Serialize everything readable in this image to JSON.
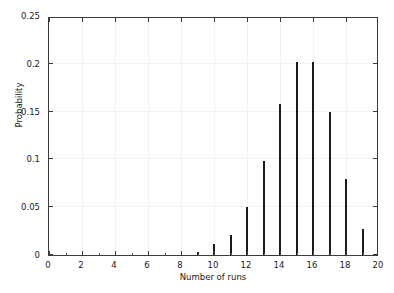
{
  "chart_data": {
    "type": "bar",
    "title": "",
    "subtitle": "",
    "xlabel": "Number of runs",
    "ylabel": "Probability",
    "xlim": [
      0,
      20
    ],
    "ylim": [
      0,
      0.25
    ],
    "grid": true,
    "legend": null,
    "legend_position": "none",
    "bar_color": "#1a1a1a",
    "x_ticks_major": [
      0,
      2,
      4,
      6,
      8,
      10,
      12,
      14,
      16,
      18,
      20
    ],
    "x_tick_labels": [
      "0",
      "2",
      "4",
      "6",
      "8",
      "10",
      "12",
      "14",
      "16",
      "18",
      "20"
    ],
    "x_ticks_minor": [
      1,
      3,
      5,
      7,
      9,
      11,
      13,
      15,
      17,
      19
    ],
    "y_ticks_major": [
      0,
      0.05,
      0.1,
      0.15,
      0.2,
      0.25
    ],
    "y_tick_labels": [
      "0",
      "0.05",
      "0.1",
      "0.15",
      "0.2",
      "0.25"
    ],
    "categories": [
      9,
      10,
      11,
      12,
      13,
      14,
      15,
      16,
      17,
      18,
      19
    ],
    "values": [
      0.003,
      0.011,
      0.021,
      0.05,
      0.098,
      0.158,
      0.202,
      0.202,
      0.15,
      0.08,
      0.027
    ],
    "annotations": []
  },
  "figure": {
    "background_color": "#ffffff",
    "axes_color": "#3a3a3a",
    "grid_color": "#f2f2f2"
  }
}
